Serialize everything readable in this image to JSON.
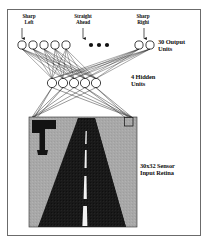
{
  "figure": {
    "background_color": "#ffffff",
    "frame_color": "#6b6b6b"
  },
  "labels": {
    "sharp_left": "Sharp\nLeft",
    "sharp_left_line1": "Sharp",
    "sharp_left_line2": "Left",
    "straight_ahead_line1": "Straight",
    "straight_ahead_line2": "Ahead",
    "sharp_right_line1": "Sharp",
    "sharp_right_line2": "Righi",
    "output_units_line1": "30 Output",
    "output_units_line2": "Units",
    "hidden_units_line1": "4 Hidden",
    "hidden_units_line2": "Units",
    "retina_line1": "30x32 Sensor",
    "retina_line2": "Input Retina"
  },
  "network": {
    "output_layer": {
      "name": "output-units",
      "count_label": "30 Output Units",
      "visible_nodes": 7,
      "ellipsis_dots": 3,
      "node_radius": 4.1,
      "node_y": 45,
      "node_x": [
        22,
        33,
        44,
        55,
        66,
        139,
        150
      ],
      "dot_x": [
        91,
        99,
        107
      ],
      "dot_y": 45,
      "dot_radius": 2.1,
      "arrow_indices": [
        0,
        4,
        6
      ]
    },
    "hidden_layer": {
      "name": "hidden-units",
      "count_label": "4 Hidden Units",
      "visible_nodes": 5,
      "node_radius": 4.6,
      "node_y": 83,
      "node_x": [
        52,
        63,
        74,
        85,
        96
      ]
    },
    "retina": {
      "name": "sensor-input-retina",
      "label": "30x32 Sensor Input Retina",
      "x": 29,
      "y": 117,
      "width": 108,
      "height": 110,
      "background_color": "#a8a8a8",
      "road_color": "#1a1a1a",
      "lane_color": "#f2f2f2",
      "receptive_field_square": {
        "x": 124,
        "y": 117,
        "size": 9
      }
    },
    "line_color": "#1c1c1c"
  },
  "colors": {
    "ink": "#111111",
    "retina_gray": "#a8a8a8",
    "road_dark": "#1a1a1a",
    "lane_white": "#f2f2f2",
    "frame": "#6b6b6b"
  }
}
